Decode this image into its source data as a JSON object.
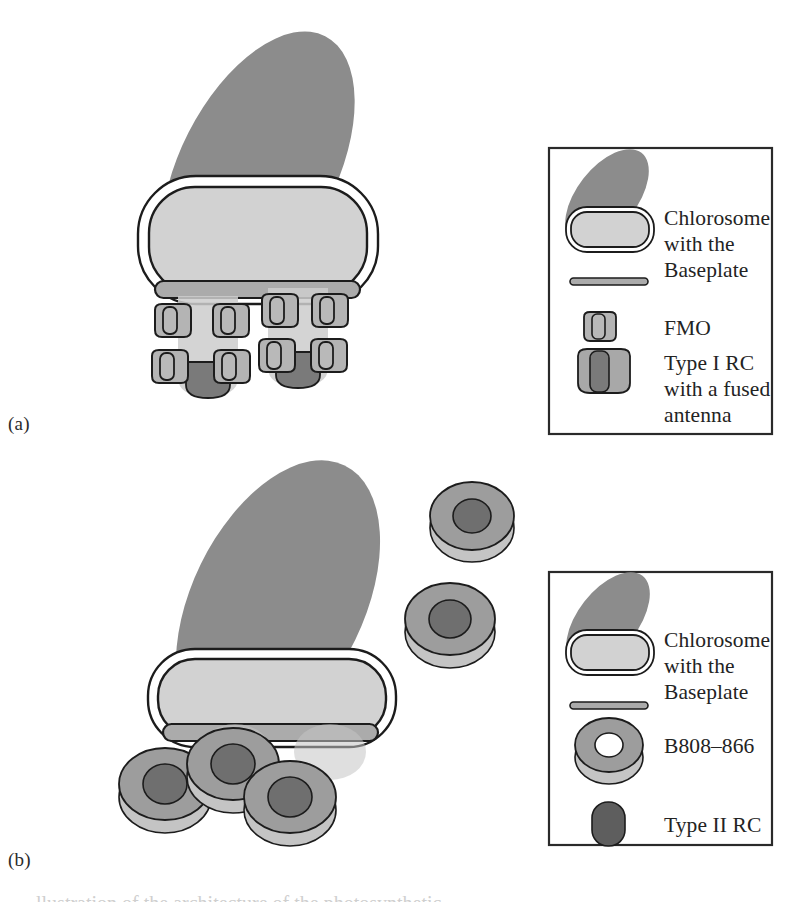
{
  "figure": {
    "type": "scientific-diagram",
    "panels": [
      {
        "id": "a",
        "label": "(a)"
      },
      {
        "id": "b",
        "label": "(b)"
      }
    ]
  },
  "panel_a": {
    "label": "(a)",
    "legend": {
      "items": [
        {
          "icon": "chlorosome-glyph",
          "label": "Chlorosome\nwith the"
        },
        {
          "icon": "baseplate-glyph",
          "label": "Baseplate"
        },
        {
          "icon": "fmo-glyph",
          "label": "FMO"
        },
        {
          "icon": "type-i-rc-glyph",
          "label": "Type I RC\nwith a fused\nantenna"
        }
      ]
    },
    "components": {
      "membrane": "cytoplasmic-membrane",
      "chlorosome": "chlorosome",
      "baseplate": "baseplate",
      "fmo_count": 8,
      "rc_count": 2
    }
  },
  "panel_b": {
    "label": "(b)",
    "legend": {
      "items": [
        {
          "icon": "chlorosome-glyph",
          "label": "Chlorosome\nwith the"
        },
        {
          "icon": "baseplate-glyph",
          "label": "Baseplate"
        },
        {
          "icon": "b808-866-glyph",
          "label": "B808–866"
        },
        {
          "icon": "type-ii-rc-glyph",
          "label": "Type II RC"
        }
      ]
    },
    "components": {
      "membrane": "cytoplasmic-membrane",
      "chlorosome": "chlorosome",
      "baseplate": "baseplate",
      "b808_866_count": 6
    }
  },
  "colors": {
    "membrane_gray": "#8c8c8c",
    "chlorosome_fill": "#d2d2d2",
    "chlorosome_rim": "#ffffff",
    "baseplate_gray": "#ababab",
    "fmo_fill": "#b4b4b4",
    "rc_dark": "#7a7a7a",
    "ring_outer": "#9d9d9d",
    "ring_core": "#6f6f6f",
    "ring_side": "#c4c4c4",
    "type_ii_rc": "#5e5e5e",
    "outline": "#1c1c1c",
    "text": "#232323",
    "background": "#ffffff"
  },
  "caption": {
    "partial_text": "llustration of the architecture of the photosynthetic"
  }
}
